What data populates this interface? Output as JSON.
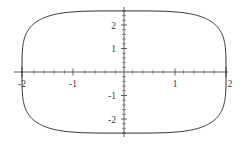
{
  "chart_data": {
    "type": "line",
    "title": "",
    "subtitle": "",
    "xlabel": "",
    "ylabel": "",
    "xlim": [
      -2.2,
      2.2
    ],
    "ylim": [
      -2.9,
      2.9
    ],
    "grid": false,
    "legend": null,
    "x_ticks_major": [
      -2,
      -1,
      1,
      2
    ],
    "x_tick_labels": [
      "-2",
      "-1",
      "1",
      "2"
    ],
    "y_ticks_major": [
      2,
      1,
      -1,
      -2
    ],
    "y_tick_labels": [
      "2",
      "1",
      "-1",
      "-2"
    ],
    "x_minor_tick_step": 0.2,
    "y_minor_tick_step": 0.2,
    "curve": {
      "name": "superellipse",
      "equation": "|x/2|^n + |y/2.6|^n = 1",
      "exponent": 4,
      "a": 2,
      "b": 2.6,
      "x_extent": [
        -2,
        2
      ],
      "y_extent": [
        -2.6,
        2.6
      ],
      "color": "#2b2b2b",
      "stroke_width": 1,
      "closed": true
    },
    "axes": {
      "x_axis_range": [
        -2.16,
        2.04
      ],
      "y_axis_range": [
        -2.78,
        2.72
      ],
      "color": "#4a4a4a"
    }
  },
  "labels": {
    "x_neg2": "-2",
    "x_neg1": "-1",
    "x_pos1": "1",
    "x_pos2": "2",
    "y_pos2": "2",
    "y_pos1": "1",
    "y_neg1": "-1",
    "y_neg2": "-2"
  }
}
